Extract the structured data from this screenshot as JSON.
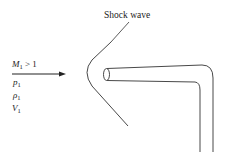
{
  "figure": {
    "title_label": "Shock wave",
    "freestream": {
      "mach": {
        "symbol": "M",
        "sub": "1",
        "rel": " > 1"
      },
      "pressure": {
        "symbol": "p",
        "sub": "1"
      },
      "density": {
        "symbol": "ρ",
        "sub": "1"
      },
      "velocity": {
        "symbol": "V",
        "sub": "1"
      }
    },
    "colors": {
      "stroke": "#333333",
      "background": "#ffffff"
    }
  }
}
